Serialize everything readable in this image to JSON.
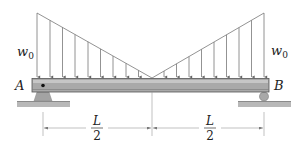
{
  "figure": {
    "type": "beam-loading-diagram"
  },
  "labels": {
    "load_left": "w",
    "load_left_sub": "0",
    "load_right": "w",
    "load_right_sub": "0",
    "support_left": "A",
    "support_right": "B",
    "dim_left_num": "L",
    "dim_left_den": "2",
    "dim_right_num": "L",
    "dim_right_den": "2"
  },
  "supports": {
    "left": "pin",
    "right": "roller"
  },
  "load": {
    "shape": "V (two triangles)",
    "max_intensity": "w0",
    "at_ends": "w0",
    "at_midspan": "0"
  },
  "colors": {
    "beam_fill": "#a9a9a9",
    "beam_stripe": "#c4c4c4",
    "beam_edge": "#555555",
    "support_fill": "#a0a0a0",
    "ground_fill": "#b5b5b5",
    "line": "#666666"
  }
}
